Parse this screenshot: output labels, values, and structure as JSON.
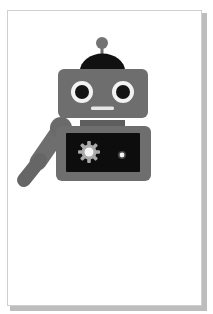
{
  "card": {
    "background": "#ffffff",
    "border": "#cfcfcf",
    "shadow": "#bdbdbd"
  },
  "illustration": {
    "subject": "robot",
    "caption": "Robot illustration",
    "colors": {
      "body": "#6e6e6e",
      "body_dark": "#5c5c5c",
      "dome": "#111111",
      "screen": "#0d0d0d",
      "eye_white": "#f2f2f2",
      "pupil": "#141414",
      "mouth": "#e6e6e6",
      "gear": "#a9a9a9",
      "light": "#f5f5f5"
    },
    "parts": [
      {
        "name": "antenna",
        "icon": "antenna-icon"
      },
      {
        "name": "dome",
        "icon": "dome-icon"
      },
      {
        "name": "head",
        "icon": "head-icon"
      },
      {
        "name": "left-eye",
        "icon": "eye-icon"
      },
      {
        "name": "right-eye",
        "icon": "eye-icon"
      },
      {
        "name": "mouth",
        "icon": "mouth-icon"
      },
      {
        "name": "neck",
        "icon": "neck-icon"
      },
      {
        "name": "body",
        "icon": "body-icon"
      },
      {
        "name": "chest-screen",
        "icon": "screen-icon"
      },
      {
        "name": "gear",
        "icon": "gear-icon"
      },
      {
        "name": "status-light",
        "icon": "light-icon"
      },
      {
        "name": "raised-arm",
        "icon": "arm-icon"
      }
    ]
  }
}
